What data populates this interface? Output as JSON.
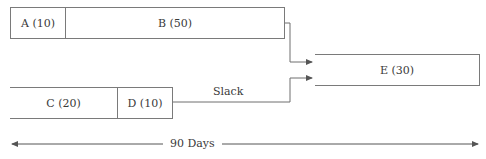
{
  "diagram": {
    "tasks": [
      {
        "id": "A",
        "label": "A (10)",
        "duration": 10
      },
      {
        "id": "B",
        "label": "B (50)",
        "duration": 50
      },
      {
        "id": "C",
        "label": "C (20)",
        "duration": 20
      },
      {
        "id": "D",
        "label": "D (10)",
        "duration": 10
      },
      {
        "id": "E",
        "label": "E (30)",
        "duration": 30
      }
    ],
    "connectors": [
      {
        "from": "B",
        "to": "E"
      },
      {
        "from": "D",
        "to": "E",
        "label": "Slack"
      }
    ],
    "slack_label": "Slack",
    "timeline_label": "90 Days",
    "colors": {
      "line": "#6e6e6e",
      "box_border": "#7a7a7a",
      "text": "#3a3a3a"
    }
  }
}
